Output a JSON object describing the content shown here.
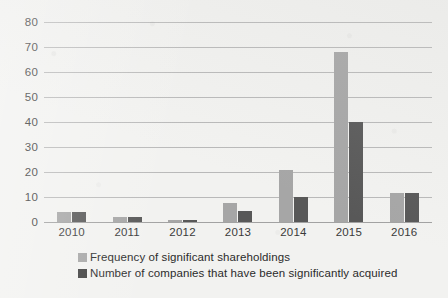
{
  "chart_data": {
    "type": "bar",
    "title": "",
    "subtitle": "",
    "xlabel": "",
    "ylabel": "",
    "categories": [
      "2010",
      "2011",
      "2012",
      "2013",
      "2014",
      "2015",
      "2016"
    ],
    "series": [
      {
        "name": "Frequency of significant shareholdings",
        "color": "#a6a6a6",
        "values": [
          4,
          2,
          0.7,
          7.5,
          21,
          68,
          11.5
        ]
      },
      {
        "name": "Number of companies that have been significantly acquired",
        "color": "#585858",
        "values": [
          4,
          2,
          0.7,
          4.5,
          10,
          40,
          11.5
        ]
      }
    ],
    "ylim": [
      0,
      80
    ],
    "yticks": [
      0,
      10,
      20,
      30,
      40,
      50,
      60,
      70,
      80
    ],
    "ytick_labels": [
      "0",
      "10",
      "20",
      "30",
      "40",
      "50",
      "60",
      "70",
      "80"
    ],
    "grid": "horizontal",
    "legend_position": "bottom-left",
    "bar_group_order": [
      "Frequency of significant shareholdings",
      "Number of companies that have been significantly acquired"
    ]
  },
  "legend": {
    "items": [
      {
        "label": "Frequency of significant shareholdings",
        "color": "#a6a6a6"
      },
      {
        "label": "Number of companies that have been significantly acquired",
        "color": "#3f3f3f"
      }
    ]
  }
}
